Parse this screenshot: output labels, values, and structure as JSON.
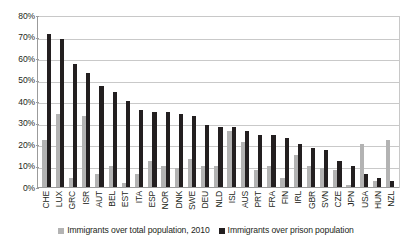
{
  "chart_data": {
    "type": "bar",
    "title": "",
    "xlabel": "",
    "ylabel": "",
    "ylim": [
      0,
      80
    ],
    "ytick_labels": [
      "80%",
      "70%",
      "60%",
      "50%",
      "40%",
      "30%",
      "20%",
      "10%",
      "0%"
    ],
    "ytick_values": [
      80,
      70,
      60,
      50,
      40,
      30,
      20,
      10,
      0
    ],
    "grid": true,
    "legend_position": "bottom",
    "categories": [
      "CHE",
      "LUX",
      "GRC",
      "ISR",
      "AUT",
      "BEL",
      "EST",
      "ITA",
      "ESP",
      "NOR",
      "DNK",
      "SWE",
      "DEU",
      "NLD",
      "ISL",
      "AUS",
      "PRT",
      "FRA",
      "FIN",
      "IRL",
      "GBR",
      "SVN",
      "CZE",
      "JPN",
      "USA",
      "HUN",
      "NZL"
    ],
    "series": [
      {
        "name": "Immigrants over total population, 2010",
        "color": "#b3b3b3",
        "values": [
          22,
          34,
          4,
          33,
          6,
          10,
          2,
          6,
          12,
          10,
          9,
          13,
          10,
          10,
          26,
          21,
          8,
          10,
          4,
          15,
          10,
          9,
          8,
          1,
          20,
          3,
          22
        ]
      },
      {
        "name": "Immigrants over prison population",
        "color": "#231f20",
        "values": [
          71,
          69,
          57,
          53,
          47,
          44,
          40,
          36,
          35,
          35,
          34,
          33,
          29,
          28,
          28,
          26,
          24,
          24,
          23,
          20,
          18,
          17,
          12,
          10,
          6,
          4,
          3
        ]
      }
    ]
  },
  "legend": {
    "items": [
      {
        "label": "Immigrants over total population, 2010",
        "color": "#b3b3b3"
      },
      {
        "label": "Immigrants over prison population",
        "color": "#231f20"
      }
    ]
  },
  "colors": {
    "light_series": "#b3b3b3",
    "dark_series": "#231f20",
    "gridline": "#c9c9c9",
    "axis": "#9b9b9b",
    "background": "#ffffff"
  }
}
